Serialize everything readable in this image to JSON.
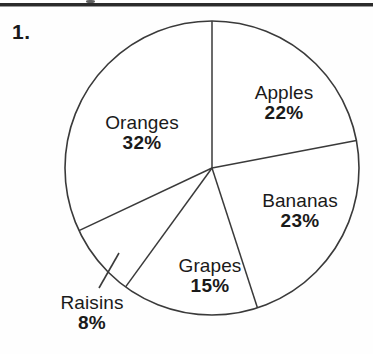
{
  "page": {
    "question_number": "1.",
    "background_color": "#fefefe",
    "rule_color": "#2b2b2b",
    "ink_color": "#1a1a1a"
  },
  "chart_data": {
    "type": "pie",
    "title": "",
    "subtitle": "",
    "xlabel": "",
    "ylabel": "",
    "legend_position": "none",
    "grid": false,
    "labels_inside_slices": true,
    "start_angle_deg": 0,
    "direction": "clockwise",
    "stroke_color": "#3a3a3a",
    "fill_color": "#ffffff",
    "categories": [
      "Apples",
      "Bananas",
      "Grapes",
      "Raisins",
      "Oranges"
    ],
    "values": [
      22,
      23,
      15,
      8,
      32
    ],
    "value_unit": "%",
    "total": 100,
    "slices": [
      {
        "name": "Apples",
        "value": 22,
        "label": "Apples",
        "percent_text": "22%",
        "start_angle_deg": 0.0,
        "end_angle_deg": 79.2,
        "leader_line": false
      },
      {
        "name": "Bananas",
        "value": 23,
        "label": "Bananas",
        "percent_text": "23%",
        "start_angle_deg": 79.2,
        "end_angle_deg": 162.0,
        "leader_line": false
      },
      {
        "name": "Grapes",
        "value": 15,
        "label": "Grapes",
        "percent_text": "15%",
        "start_angle_deg": 162.0,
        "end_angle_deg": 216.0,
        "leader_line": false
      },
      {
        "name": "Raisins",
        "value": 8,
        "label": "Raisins",
        "percent_text": "8%",
        "start_angle_deg": 216.0,
        "end_angle_deg": 244.8,
        "leader_line": true
      },
      {
        "name": "Oranges",
        "value": 32,
        "label": "Oranges",
        "percent_text": "32%",
        "start_angle_deg": 244.8,
        "end_angle_deg": 360.0,
        "leader_line": false
      }
    ],
    "geometry": {
      "center_x": 212,
      "center_y": 168,
      "radius": 147
    }
  }
}
